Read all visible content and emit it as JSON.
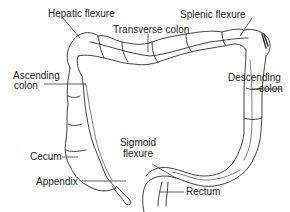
{
  "diagram": {
    "type": "anatomical illustration",
    "colors": {
      "line": "#2a2a2a",
      "text": "#1a1a1a",
      "background": "#ffffff"
    },
    "labels": {
      "hepatic_flexure": "Hepatic flexure",
      "splenic_flexure": "Splenic flexure",
      "transverse_colon": "Transverse colon",
      "ascending_colon_1": "Ascending",
      "ascending_colon_2": "colon",
      "descending_colon_1": "Descending",
      "descending_colon_2": "colon",
      "sigmoid_flexure_1": "Sigmoid",
      "sigmoid_flexure_2": "flexure",
      "cecum": "Cecum",
      "appendix": "Appendix",
      "rectum": "Rectum"
    }
  }
}
